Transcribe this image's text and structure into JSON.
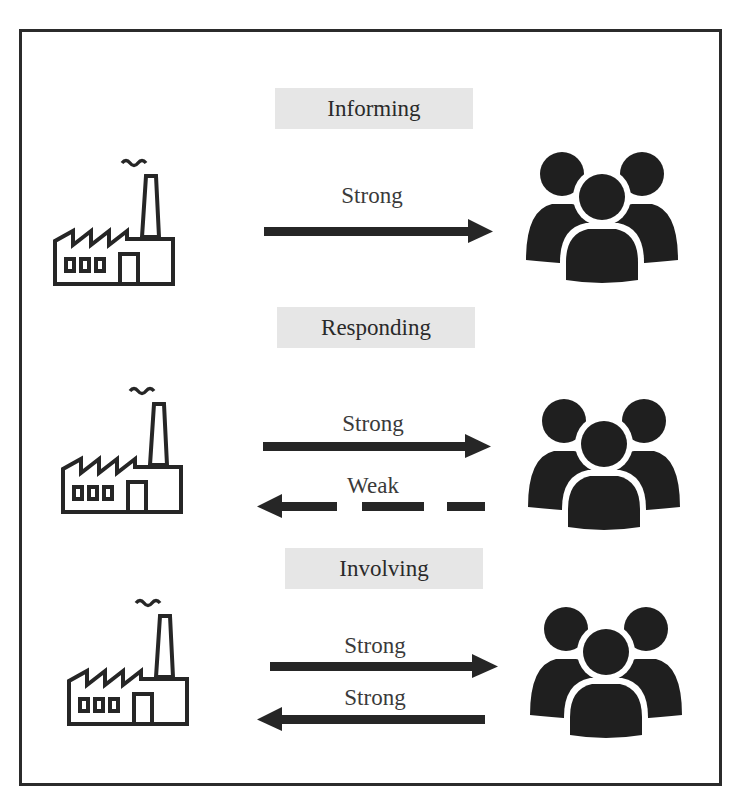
{
  "colors": {
    "ink": "#262626",
    "label_bg": "#e6e6e6",
    "frame": "#2b2b2b"
  },
  "sections": [
    {
      "title": "Informing",
      "left_icon": "factory-icon",
      "right_icon": "people-group-icon",
      "arrows": [
        {
          "label": "Strong",
          "direction": "right",
          "style": "solid"
        }
      ]
    },
    {
      "title": "Responding",
      "left_icon": "factory-icon",
      "right_icon": "people-group-icon",
      "arrows": [
        {
          "label": "Strong",
          "direction": "right",
          "style": "solid"
        },
        {
          "label": "Weak",
          "direction": "left",
          "style": "dashed"
        }
      ]
    },
    {
      "title": "Involving",
      "left_icon": "factory-icon",
      "right_icon": "people-group-icon",
      "arrows": [
        {
          "label": "Strong",
          "direction": "right",
          "style": "solid"
        },
        {
          "label": "Strong",
          "direction": "left",
          "style": "solid"
        }
      ]
    }
  ]
}
